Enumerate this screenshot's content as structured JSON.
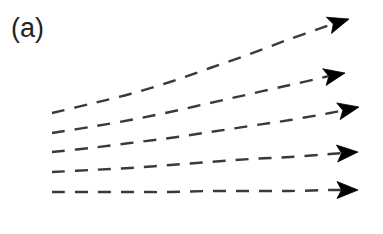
{
  "figure": {
    "panel_label": "(a)",
    "background_color": "#ffffff",
    "width": 383,
    "height": 234
  },
  "style": {
    "dash_color": "#3a3a3a",
    "arrow_color": "#000000",
    "label_color": "#232323",
    "line_width": 2.4,
    "dash_length": 13,
    "dash_gap": 10
  },
  "chart_data": {
    "type": "line",
    "title": "(a)",
    "xlabel": "",
    "ylabel": "",
    "grid": false,
    "legend": null,
    "axes_visible": false,
    "xlim": [
      0,
      383
    ],
    "ylim": [
      234,
      0
    ],
    "note": "Five dashed trajectory arrows fanning out rightward; topmost curve rises most steeply, bottom curve is nearly horizontal.",
    "series": [
      {
        "name": "trajectory-1",
        "style": "dashed",
        "arrowhead": true,
        "arrow_tip": [
          349,
          19
        ],
        "points": [
          [
            52,
            113
          ],
          [
            90,
            104
          ],
          [
            130,
            94
          ],
          [
            170,
            82
          ],
          [
            210,
            68
          ],
          [
            250,
            54
          ],
          [
            290,
            39
          ],
          [
            330,
            25
          ],
          [
            349,
            19
          ]
        ]
      },
      {
        "name": "trajectory-2",
        "style": "dashed",
        "arrowhead": true,
        "arrow_tip": [
          345,
          73
        ],
        "points": [
          [
            52,
            133
          ],
          [
            90,
            127
          ],
          [
            130,
            120
          ],
          [
            170,
            112
          ],
          [
            210,
            103
          ],
          [
            250,
            94
          ],
          [
            290,
            85
          ],
          [
            325,
            77
          ],
          [
            345,
            73
          ]
        ]
      },
      {
        "name": "trajectory-3",
        "style": "dashed",
        "arrowhead": true,
        "arrow_tip": [
          359,
          107
        ],
        "points": [
          [
            52,
            152
          ],
          [
            90,
            148
          ],
          [
            130,
            143
          ],
          [
            170,
            138
          ],
          [
            210,
            132
          ],
          [
            250,
            126
          ],
          [
            290,
            120
          ],
          [
            330,
            113
          ],
          [
            359,
            107
          ]
        ]
      },
      {
        "name": "trajectory-4",
        "style": "dashed",
        "arrowhead": true,
        "arrow_tip": [
          358,
          152
        ],
        "points": [
          [
            52,
            172
          ],
          [
            90,
            170
          ],
          [
            130,
            168
          ],
          [
            170,
            165
          ],
          [
            210,
            162
          ],
          [
            250,
            159
          ],
          [
            290,
            157
          ],
          [
            330,
            154
          ],
          [
            358,
            152
          ]
        ]
      },
      {
        "name": "trajectory-5",
        "style": "dashed",
        "arrowhead": true,
        "arrow_tip": [
          358,
          190
        ],
        "points": [
          [
            52,
            192
          ],
          [
            90,
            192
          ],
          [
            130,
            192
          ],
          [
            170,
            192
          ],
          [
            210,
            191
          ],
          [
            250,
            191
          ],
          [
            290,
            191
          ],
          [
            330,
            190
          ],
          [
            358,
            190
          ]
        ]
      }
    ]
  }
}
